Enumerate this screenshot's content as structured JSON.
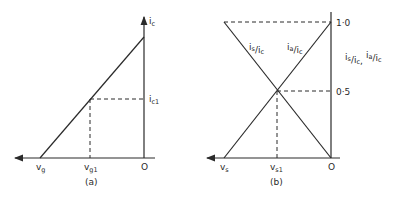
{
  "diagram_a": {
    "caption": "(a)",
    "y_axis_label": "i",
    "y_axis_label_sub": "c",
    "y_tick_label": "i",
    "y_tick_label_sub": "c1",
    "x_label_left": "v",
    "x_label_left_sub": "g",
    "x_tick_label": "v",
    "x_tick_label_sub": "g1",
    "origin_label": "O"
  },
  "diagram_b": {
    "caption": "(b)",
    "y_tick_top": "1·0",
    "y_tick_mid": "0·5",
    "origin_label": "O",
    "x_label_left": "v",
    "x_label_left_sub": "s",
    "x_tick_label": "v",
    "x_tick_label_sub": "s1",
    "line_label_falling": "i",
    "line_label_falling_sub": "s",
    "line_label_falling_den": "/i",
    "line_label_falling_den_sub": "c",
    "line_label_rising": "i",
    "line_label_rising_sub": "a",
    "line_label_rising_den": "/i",
    "line_label_rising_den_sub": "c",
    "y_axis_label": "i",
    "y_axis_label_sub": "s",
    "y_axis_label_den": "/i",
    "y_axis_label_den_sub": "c",
    "y_axis_sep": ",",
    "y_axis_label2": "i",
    "y_axis_label2_sub": "a",
    "y_axis_label2_den": "/i",
    "y_axis_label2_den_sub": "c"
  },
  "colors": {
    "line": "#2a2a2a",
    "background": "#ffffff"
  }
}
